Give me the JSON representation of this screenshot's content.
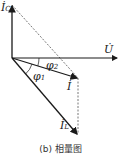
{
  "diagram": {
    "type": "phasor-diagram",
    "caption": "(b) 相量图",
    "phasors": {
      "ic": {
        "symbol": "İ",
        "subscript": "C"
      },
      "u": {
        "symbol": "U̇"
      },
      "i": {
        "symbol": "İ"
      },
      "il": {
        "symbol": "İ",
        "subscript": "L"
      }
    },
    "angles": {
      "phi1": {
        "symbol": "φ",
        "subscript": "1"
      },
      "phi2": {
        "symbol": "φ",
        "subscript": "2"
      }
    },
    "colors": {
      "stroke": "#1a1a1a",
      "dashed": "#555555"
    }
  }
}
